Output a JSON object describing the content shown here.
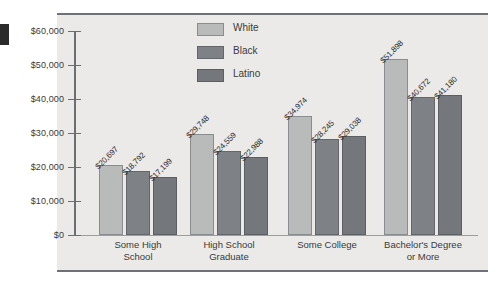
{
  "figure": {
    "name": "median-earnings-by-education-and-race-chart",
    "edge_mark": "black-edge-marker"
  },
  "legend": {
    "position": "top-center-right",
    "entries": [
      {
        "label": "White",
        "color": "#b9bbbb",
        "icon": "legend-swatch-white"
      },
      {
        "label": "Black",
        "color": "#7e8286",
        "icon": "legend-swatch-black"
      },
      {
        "label": "Latino",
        "color": "#74787c",
        "icon": "legend-swatch-latino"
      }
    ]
  },
  "yaxis": {
    "ticks": [
      "$60,000",
      "$50,000",
      "$40,000",
      "$30,000",
      "$20,000",
      "$10,000",
      "$0"
    ]
  },
  "categories": [
    {
      "line1": "Some High",
      "line2": "School"
    },
    {
      "line1": "High School",
      "line2": "Graduate"
    },
    {
      "line1": "Some College",
      "line2": ""
    },
    {
      "line1": "Bachelor's Degree",
      "line2": "or More"
    }
  ],
  "bar_labels": [
    [
      "$20,697",
      "$18,792",
      "$17,199"
    ],
    [
      "$29,748",
      "$24,559",
      "$22,988"
    ],
    [
      "$34,974",
      "$28,245",
      "$29,038"
    ],
    [
      "$51,898",
      "$40,672",
      "$41,180"
    ]
  ],
  "chart_data": {
    "type": "bar",
    "title": "",
    "subtitle": "",
    "xlabel": "",
    "ylabel": "",
    "grid": false,
    "legend_position": "top-center",
    "categories": [
      "Some High School",
      "High School Graduate",
      "Some College",
      "Bachelor's Degree or More"
    ],
    "series": [
      {
        "name": "White",
        "color": "#b9bbbb",
        "values": [
          20697,
          29748,
          34974,
          51898
        ]
      },
      {
        "name": "Black",
        "color": "#7e8286",
        "values": [
          18792,
          24559,
          28245,
          40672
        ]
      },
      {
        "name": "Latino",
        "color": "#74787c",
        "values": [
          17199,
          22988,
          29038,
          41180
        ]
      }
    ],
    "value_labels": [
      [
        "$20,697",
        "$18,792",
        "$17,199"
      ],
      [
        "$29,748",
        "$24,559",
        "$22,988"
      ],
      [
        "$34,974",
        "$28,245",
        "$29,038"
      ],
      [
        "$51,898",
        "$40,672",
        "$41,180"
      ]
    ],
    "ylim": [
      0,
      60000
    ],
    "ytick_values": [
      0,
      10000,
      20000,
      30000,
      40000,
      50000,
      60000
    ],
    "ytick_labels": [
      "$0",
      "$10,000",
      "$20,000",
      "$30,000",
      "$40,000",
      "$50,000",
      "$60,000"
    ]
  }
}
